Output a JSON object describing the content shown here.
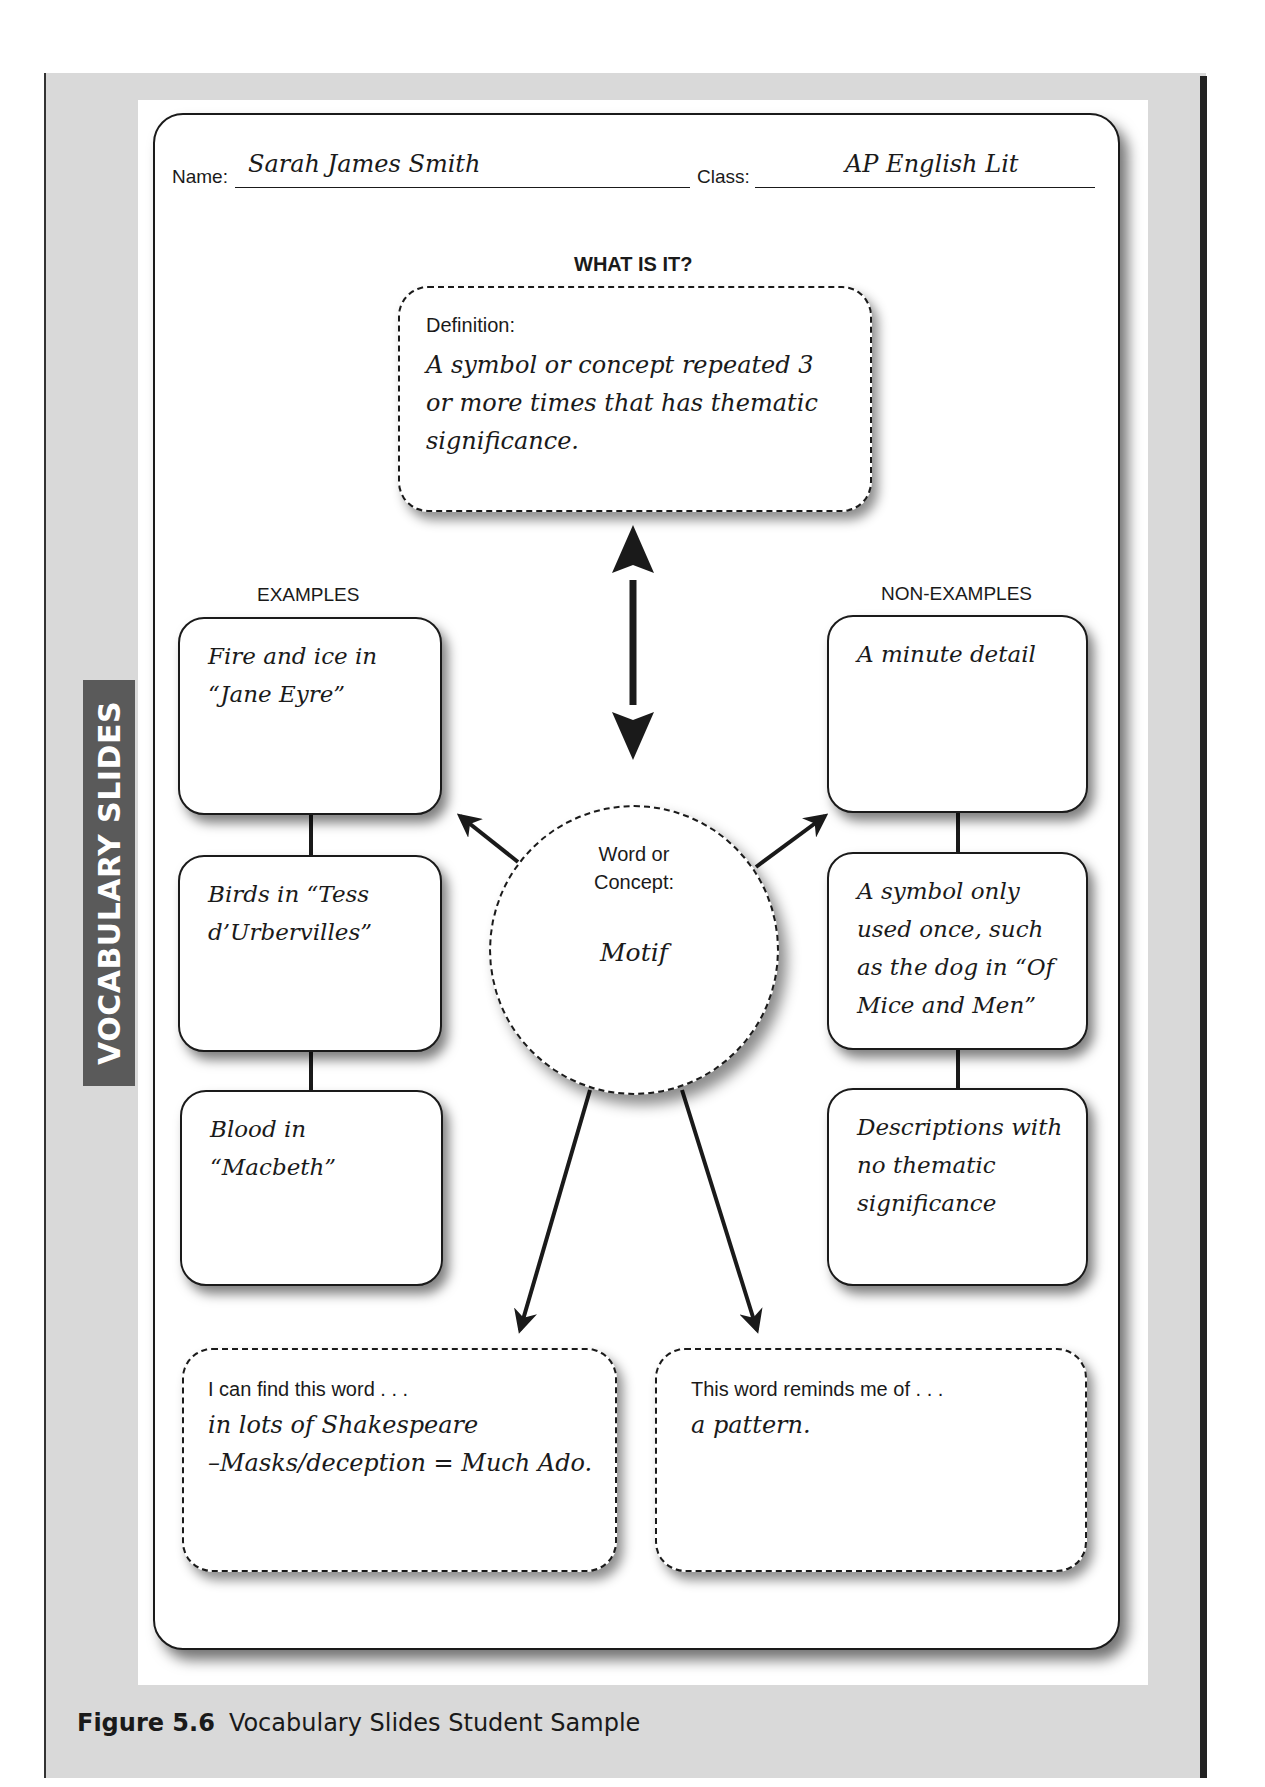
{
  "side_tab": {
    "label": "VOCABULARY SLIDES"
  },
  "header": {
    "name_label": "Name:",
    "name_value": "Sarah James Smith",
    "class_label": "Class:",
    "class_value": "AP English Lit"
  },
  "definition": {
    "heading": "WHAT IS IT?",
    "label": "Definition:",
    "value": "A symbol or concept repeated 3 or more times that has thematic significance."
  },
  "examples": {
    "heading": "EXAMPLES",
    "items": [
      {
        "text": "Fire and ice in “Jane Eyre”"
      },
      {
        "text": "Birds in “Tess d’Urbervilles”"
      },
      {
        "text": "Blood in “Macbeth”"
      }
    ]
  },
  "non_examples": {
    "heading": "NON-EXAMPLES",
    "items": [
      {
        "text": "A minute detail"
      },
      {
        "text": "A symbol only used once, such as the dog in “Of Mice and Men”"
      },
      {
        "text": "Descriptions with no thematic significance"
      }
    ]
  },
  "concept": {
    "label_line1": "Word or",
    "label_line2": "Concept:",
    "value": "Motif"
  },
  "find_word": {
    "label": "I can find this word . . .",
    "value_line1": "in lots of Shakespeare",
    "value_line2": "–Masks/deception = Much Ado."
  },
  "reminds_me": {
    "label": "This word reminds me of . . .",
    "value": "a pattern."
  },
  "caption": {
    "figure": "Figure 5.6",
    "title": "Vocabulary Slides Student Sample"
  }
}
